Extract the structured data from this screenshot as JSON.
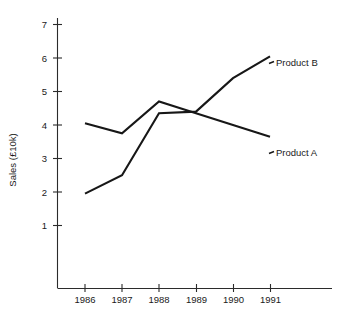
{
  "chart_data": {
    "type": "line",
    "title": "",
    "xlabel": "",
    "ylabel": "Sales (£10k)",
    "categories": [
      "1986",
      "1987",
      "1988",
      "1989",
      "1990",
      "1991"
    ],
    "x": [
      1986,
      1987,
      1988,
      1989,
      1990,
      1991
    ],
    "series": [
      {
        "name": "Product A",
        "label": "Product A",
        "values": [
          4.05,
          3.75,
          4.7,
          4.35,
          4.0,
          3.65
        ],
        "color": "#171717"
      },
      {
        "name": "Product B",
        "label": "Product B",
        "values": [
          1.95,
          2.5,
          4.35,
          4.4,
          5.4,
          6.05
        ],
        "color": "#171717"
      }
    ],
    "ylim": [
      0,
      7.4
    ],
    "y_ticks": [
      1,
      2,
      3,
      4,
      5,
      6,
      7
    ],
    "y_tick_labels": [
      "1",
      "2",
      "3",
      "4",
      "5",
      "6",
      "7"
    ],
    "x_tick_labels": [
      "1986",
      "1987",
      "1988",
      "1989",
      "1990",
      "1991"
    ],
    "grid": false,
    "legend": "inline-end-labels",
    "legend_position": "right-of-line-ends"
  },
  "axes": {
    "y_title": "Sales (£10k)",
    "y_ticks": [
      {
        "label": "7"
      },
      {
        "label": "6"
      },
      {
        "label": "5"
      },
      {
        "label": "4"
      },
      {
        "label": "3"
      },
      {
        "label": "2"
      },
      {
        "label": "1"
      }
    ],
    "x_ticks": [
      {
        "label": "1986"
      },
      {
        "label": "1987"
      },
      {
        "label": "1988"
      },
      {
        "label": "1989"
      },
      {
        "label": "1990"
      },
      {
        "label": "1991"
      }
    ]
  },
  "series_labels": {
    "product_b": "Product B",
    "product_a": "Product A"
  }
}
